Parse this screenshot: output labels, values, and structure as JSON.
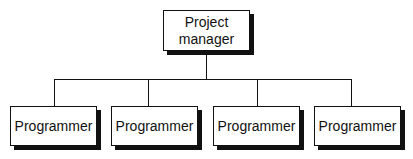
{
  "diagram": {
    "type": "org-chart",
    "root": {
      "label": "Project manager"
    },
    "children": [
      {
        "label": "Programmer"
      },
      {
        "label": "Programmer"
      },
      {
        "label": "Programmer"
      },
      {
        "label": "Programmer"
      }
    ],
    "colors": {
      "line": "#111111",
      "box_fill": "#ffffff",
      "shadow": "#111111"
    }
  }
}
